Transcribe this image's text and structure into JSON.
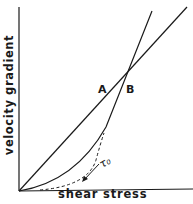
{
  "diagram": {
    "type": "rheology flow curves",
    "axes": {
      "x_label": "shear stress",
      "y_label": "velocity gradient"
    },
    "curves": [
      {
        "id": "A",
        "label": "A",
        "style": "solid",
        "shape": "straight line through origin (Newtonian)"
      },
      {
        "id": "B",
        "label": "B",
        "style": "solid",
        "shape": "curve from origin, concave up, then linear (plastic/pseudoplastic)"
      },
      {
        "id": "extrapolation",
        "label": "",
        "style": "dashed",
        "shape": "dashed extrapolation of curve B toward x-axis"
      }
    ],
    "annotation": {
      "label": "τ₀",
      "meaning": "yield value",
      "arrow": "points down-left to x-axis intercept of dashed curve"
    },
    "colors": {
      "ink": "#1a1a1a",
      "background": "#ffffff"
    }
  }
}
